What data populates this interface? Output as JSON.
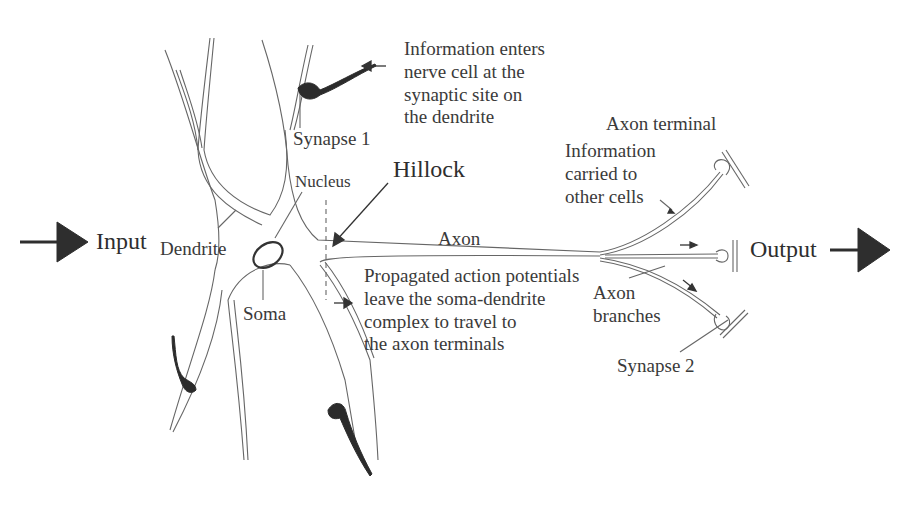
{
  "figure": {
    "title_fragment": "",
    "labels": {
      "input": "Input",
      "output": "Output",
      "dendrite": "Dendrite",
      "nucleus": "Nucleus",
      "hillock": "Hillock",
      "soma": "Soma",
      "axon": "Axon",
      "synapse1": "Synapse 1",
      "synapse2": "Synapse 2",
      "axon_terminal": "Axon terminal",
      "axon_branches": "Axon\nbranches"
    },
    "annotations": {
      "info_enters": "Information enters\nnerve cell at the\nsynaptic site on\nthe dendrite",
      "info_carried": "Information\ncarried to\nother cells",
      "propagated": "Propagated action potentials\nleave the soma-dendrite\ncomplex to travel to\nthe axon terminals"
    },
    "colors": {
      "line": "#555555",
      "fill_dark": "#2b2b2b",
      "text": "#3a3a3a",
      "background": "#ffffff"
    }
  }
}
